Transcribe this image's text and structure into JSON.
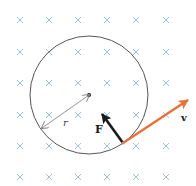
{
  "diagram": {
    "field": {
      "symbol": "×",
      "meaning": "magnetic field into page",
      "color": "#9cc3dc",
      "columns_x": [
        20,
        49,
        78,
        107,
        136,
        166
      ],
      "rows_y": [
        20,
        52,
        83,
        115,
        146,
        177
      ]
    },
    "circle": {
      "cx": 89,
      "cy": 95,
      "r": 59,
      "stroke": "#555555"
    },
    "center_dot": {
      "cx": 89,
      "cy": 95,
      "r": 2
    },
    "radius": {
      "label": "r",
      "from": [
        89,
        95
      ],
      "to": [
        42,
        128
      ],
      "color": "#8a8a8a",
      "label_pos": [
        63,
        126
      ]
    },
    "force": {
      "label": "F",
      "tail": [
        123,
        143
      ],
      "head": [
        102,
        114
      ],
      "color": "#1a1a1a",
      "label_pos": [
        95,
        133
      ]
    },
    "velocity": {
      "label": "v",
      "tail": [
        123,
        143
      ],
      "head": [
        188,
        100
      ],
      "color": "#e8703a",
      "label_pos": [
        181,
        121
      ]
    },
    "particle_point": [
      123,
      143
    ]
  }
}
